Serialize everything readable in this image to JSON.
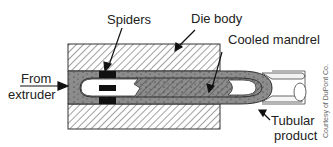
{
  "figure": {
    "labels": {
      "spiders": "Spiders",
      "die_body": "Die body",
      "cooled_mandrel": "Cooled mandrel",
      "from_extruder_line1": "From",
      "from_extruder_line2": "extruder",
      "tubular_line1": "Tubular",
      "tubular_line2": "product"
    },
    "credit": "Courtesy of DuPont Co.",
    "colors": {
      "melt": "#8c8c8c",
      "spider": "#111111",
      "outline": "#333333",
      "hatch": "#444444"
    }
  }
}
